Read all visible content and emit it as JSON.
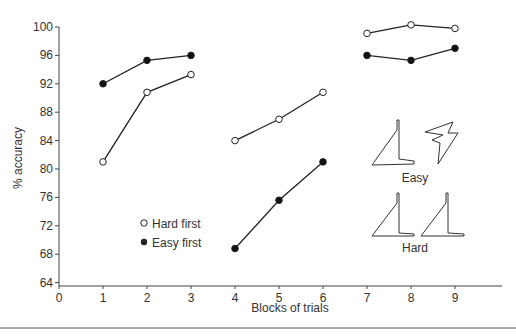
{
  "chart_data": {
    "type": "line",
    "title": "",
    "xlabel": "Blocks of trials",
    "ylabel": "% accuracy",
    "x_ticks": [
      0,
      1,
      2,
      3,
      4,
      5,
      6,
      7,
      8,
      9
    ],
    "y_ticks": [
      64,
      68,
      72,
      76,
      80,
      84,
      88,
      92,
      96,
      100
    ],
    "xlim": [
      0,
      10
    ],
    "ylim": [
      63,
      101
    ],
    "grid": false,
    "legend_position": "inside-lower-left",
    "series": [
      {
        "name": "Hard first",
        "marker": "open-circle",
        "segments": [
          {
            "x": [
              1,
              2,
              3
            ],
            "y": [
              81,
              90.8,
              93.3
            ]
          },
          {
            "x": [
              4,
              5,
              6
            ],
            "y": [
              84,
              87,
              90.8
            ]
          },
          {
            "x": [
              7,
              8,
              9
            ],
            "y": [
              99.1,
              100.3,
              99.8
            ]
          }
        ]
      },
      {
        "name": "Easy first",
        "marker": "filled-circle",
        "segments": [
          {
            "x": [
              1,
              2,
              3
            ],
            "y": [
              92,
              95.3,
              96
            ]
          },
          {
            "x": [
              4,
              5,
              6
            ],
            "y": [
              68.8,
              75.6,
              81
            ]
          },
          {
            "x": [
              7,
              8,
              9
            ],
            "y": [
              96,
              95.3,
              97
            ]
          }
        ]
      }
    ],
    "annotations": [
      "Easy",
      "Hard"
    ]
  },
  "legend": {
    "hard": "Hard first",
    "easy": "Easy first"
  },
  "labels": {
    "easy": "Easy",
    "hard": "Hard",
    "xlabel": "Blocks of trials",
    "ylabel": "% accuracy"
  }
}
